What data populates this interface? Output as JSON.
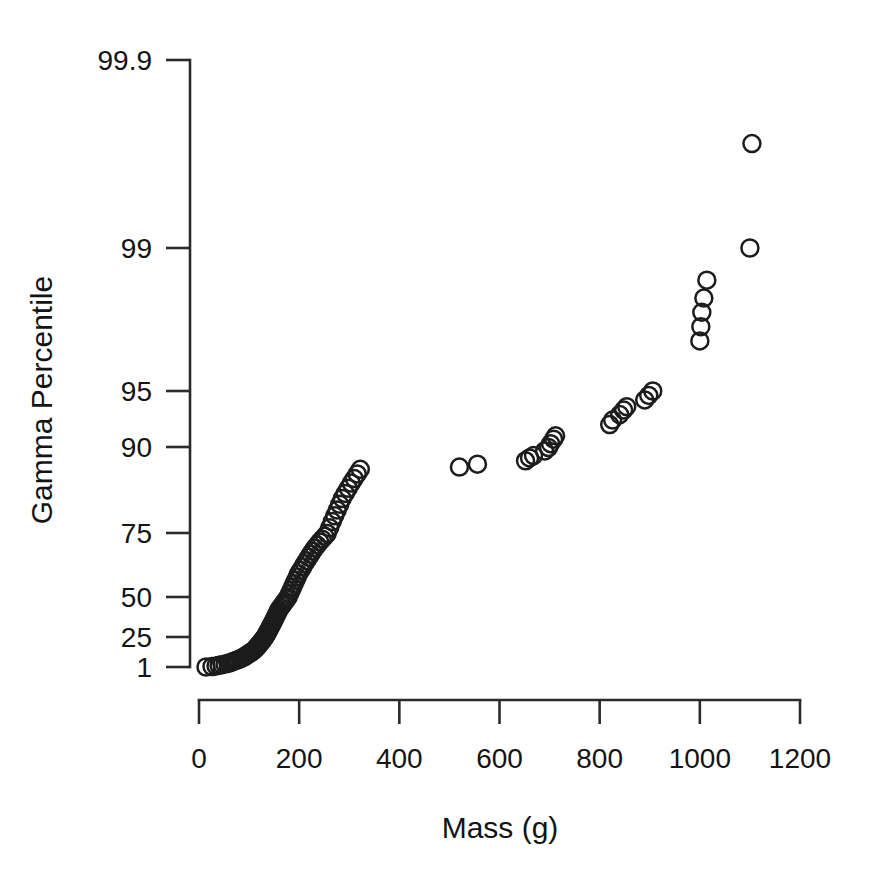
{
  "chart_data": {
    "type": "scatter",
    "title": "",
    "subtitle": "",
    "xlabel": "Mass (g)",
    "ylabel": "Gamma Percentile",
    "grid": false,
    "legend": "none",
    "marker": "open-circle",
    "marker_color": "#1c1c1c",
    "xlim": [
      0,
      1200
    ],
    "ylim_label_scale": "gamma probability",
    "xticks": [
      0,
      200,
      400,
      600,
      800,
      1000,
      1200
    ],
    "xticklabels": [
      "0",
      "200",
      "400",
      "600",
      "800",
      "1000",
      "1200"
    ],
    "yticks": [
      1,
      25,
      50,
      75,
      90,
      95,
      99,
      99.9
    ],
    "yticklabels": [
      "1",
      "25",
      "50",
      "75",
      "90",
      "95",
      "99",
      "99.9"
    ],
    "ytick_pixel_positions": [
      667,
      637,
      597,
      533,
      447,
      391,
      248,
      60
    ],
    "axis_pixel_reference": {
      "x_zero_px": 199,
      "x_1200_px": 800,
      "y_axis_px": 190,
      "x_axis_px": 700
    },
    "n_points": 115,
    "points": [
      {
        "x": 14,
        "y": 1.0
      },
      {
        "x": 26,
        "y": 1.4
      },
      {
        "x": 34,
        "y": 1.9
      },
      {
        "x": 40,
        "y": 2.4
      },
      {
        "x": 46,
        "y": 2.9
      },
      {
        "x": 52,
        "y": 3.4
      },
      {
        "x": 58,
        "y": 3.9
      },
      {
        "x": 62,
        "y": 4.5
      },
      {
        "x": 66,
        "y": 5.1
      },
      {
        "x": 70,
        "y": 5.7
      },
      {
        "x": 74,
        "y": 6.3
      },
      {
        "x": 78,
        "y": 6.9
      },
      {
        "x": 82,
        "y": 7.6
      },
      {
        "x": 86,
        "y": 8.3
      },
      {
        "x": 90,
        "y": 9.0
      },
      {
        "x": 92,
        "y": 9.7
      },
      {
        "x": 95,
        "y": 10.4
      },
      {
        "x": 98,
        "y": 11.2
      },
      {
        "x": 101,
        "y": 12.0
      },
      {
        "x": 104,
        "y": 12.8
      },
      {
        "x": 107,
        "y": 13.6
      },
      {
        "x": 110,
        "y": 14.5
      },
      {
        "x": 112,
        "y": 15.3
      },
      {
        "x": 114,
        "y": 16.2
      },
      {
        "x": 116,
        "y": 17.1
      },
      {
        "x": 118,
        "y": 18.0
      },
      {
        "x": 120,
        "y": 19.0
      },
      {
        "x": 122,
        "y": 20.0
      },
      {
        "x": 124,
        "y": 21.0
      },
      {
        "x": 126,
        "y": 22.0
      },
      {
        "x": 128,
        "y": 23.0
      },
      {
        "x": 130,
        "y": 24.1
      },
      {
        "x": 132,
        "y": 25.2
      },
      {
        "x": 134,
        "y": 26.3
      },
      {
        "x": 136,
        "y": 27.4
      },
      {
        "x": 138,
        "y": 28.5
      },
      {
        "x": 140,
        "y": 29.7
      },
      {
        "x": 142,
        "y": 30.9
      },
      {
        "x": 144,
        "y": 32.1
      },
      {
        "x": 146,
        "y": 33.3
      },
      {
        "x": 148,
        "y": 34.5
      },
      {
        "x": 150,
        "y": 35.8
      },
      {
        "x": 152,
        "y": 37.0
      },
      {
        "x": 154,
        "y": 38.3
      },
      {
        "x": 156,
        "y": 39.6
      },
      {
        "x": 158,
        "y": 40.9
      },
      {
        "x": 160,
        "y": 42.2
      },
      {
        "x": 163,
        "y": 43.5
      },
      {
        "x": 166,
        "y": 44.8
      },
      {
        "x": 169,
        "y": 46.1
      },
      {
        "x": 172,
        "y": 47.4
      },
      {
        "x": 175,
        "y": 48.7
      },
      {
        "x": 178,
        "y": 50.0
      },
      {
        "x": 181,
        "y": 51.3
      },
      {
        "x": 184,
        "y": 52.6
      },
      {
        "x": 187,
        "y": 53.9
      },
      {
        "x": 190,
        "y": 55.2
      },
      {
        "x": 193,
        "y": 56.5
      },
      {
        "x": 196,
        "y": 57.8
      },
      {
        "x": 199,
        "y": 59.1
      },
      {
        "x": 203,
        "y": 60.4
      },
      {
        "x": 207,
        "y": 61.7
      },
      {
        "x": 211,
        "y": 63.0
      },
      {
        "x": 215,
        "y": 64.2
      },
      {
        "x": 219,
        "y": 65.5
      },
      {
        "x": 223,
        "y": 66.7
      },
      {
        "x": 227,
        "y": 67.9
      },
      {
        "x": 231,
        "y": 69.1
      },
      {
        "x": 236,
        "y": 70.3
      },
      {
        "x": 241,
        "y": 71.5
      },
      {
        "x": 246,
        "y": 72.6
      },
      {
        "x": 251,
        "y": 73.7
      },
      {
        "x": 256,
        "y": 74.8
      },
      {
        "x": 261,
        "y": 75.9
      },
      {
        "x": 266,
        "y": 77.0
      },
      {
        "x": 271,
        "y": 78.0
      },
      {
        "x": 276,
        "y": 79.0
      },
      {
        "x": 281,
        "y": 80.0
      },
      {
        "x": 286,
        "y": 81.0
      },
      {
        "x": 292,
        "y": 81.9
      },
      {
        "x": 298,
        "y": 82.8
      },
      {
        "x": 304,
        "y": 83.7
      },
      {
        "x": 310,
        "y": 84.5
      },
      {
        "x": 316,
        "y": 85.3
      },
      {
        "x": 322,
        "y": 86.1
      },
      {
        "x": 520,
        "y": 86.5
      },
      {
        "x": 556,
        "y": 87.0
      },
      {
        "x": 652,
        "y": 87.6
      },
      {
        "x": 660,
        "y": 88.1
      },
      {
        "x": 668,
        "y": 88.5
      },
      {
        "x": 690,
        "y": 89.3
      },
      {
        "x": 698,
        "y": 89.9
      },
      {
        "x": 702,
        "y": 90.3
      },
      {
        "x": 708,
        "y": 90.7
      },
      {
        "x": 712,
        "y": 91.0
      },
      {
        "x": 820,
        "y": 92.0
      },
      {
        "x": 826,
        "y": 92.4
      },
      {
        "x": 840,
        "y": 92.9
      },
      {
        "x": 848,
        "y": 93.3
      },
      {
        "x": 854,
        "y": 93.6
      },
      {
        "x": 890,
        "y": 94.2
      },
      {
        "x": 898,
        "y": 94.6
      },
      {
        "x": 906,
        "y": 95.0
      },
      {
        "x": 1000,
        "y": 96.4
      },
      {
        "x": 1002,
        "y": 96.8
      },
      {
        "x": 1004,
        "y": 97.2
      },
      {
        "x": 1008,
        "y": 97.6
      },
      {
        "x": 1014,
        "y": 98.1
      },
      {
        "x": 1100,
        "y": 99.0
      },
      {
        "x": 1104,
        "y": 99.5
      }
    ]
  },
  "axes": {
    "y_title": "Gamma Percentile",
    "x_title": "Mass (g)"
  }
}
